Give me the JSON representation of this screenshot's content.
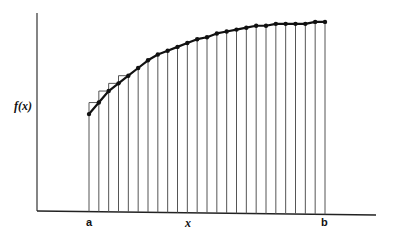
{
  "chart_data": {
    "type": "line",
    "title": "",
    "xlabel": "x",
    "ylabel": "f(x)",
    "x_tick_labels": [
      "a",
      "b"
    ],
    "n_points": 25,
    "n_intervals": 24,
    "x": [
      0,
      1,
      2,
      3,
      4,
      5,
      6,
      7,
      8,
      9,
      10,
      11,
      12,
      13,
      14,
      15,
      16,
      17,
      18,
      19,
      20,
      21,
      22,
      23,
      24
    ],
    "values": [
      0.51,
      0.57,
      0.63,
      0.67,
      0.71,
      0.75,
      0.79,
      0.82,
      0.84,
      0.86,
      0.88,
      0.9,
      0.91,
      0.93,
      0.94,
      0.95,
      0.96,
      0.97,
      0.97,
      0.98,
      0.98,
      0.98,
      0.98,
      0.99,
      0.99
    ],
    "grid": false,
    "legend": null,
    "step_rectangles_on_intervals": [
      0,
      1,
      2,
      3
    ]
  },
  "labels": {
    "y_axis": "f(x)",
    "x_axis": "x",
    "a": "a",
    "b": "b"
  },
  "style": {
    "line_color": "#111111",
    "ordinate_color": "#555555",
    "axis_color": "#222222"
  }
}
